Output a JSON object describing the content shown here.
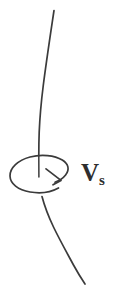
{
  "figure": {
    "background_color": "#ffffff",
    "stroke_color": "#3b3b3b",
    "label": {
      "symbol": "V",
      "subscript": "s",
      "full_text": "Vs",
      "color": "#2e2e2e"
    },
    "elements": {
      "upper_curve_name": "upper-axis-curve",
      "lower_curve_name": "lower-axis-curve",
      "rotation_ellipse_name": "rotation-ellipse",
      "rotation_arrowhead_name": "rotation-arrowhead",
      "inner_segment_name": "axis-inner-segment"
    },
    "geometry": {
      "canvas_width": 116,
      "canvas_height": 299,
      "ellipse_center_x": 39,
      "ellipse_center_y": 174,
      "ellipse_rx": 29,
      "ellipse_ry": 19,
      "upper_curve_top_x": 54,
      "upper_curve_top_y": 10,
      "lower_curve_end_x": 85,
      "lower_curve_end_y": 284
    }
  }
}
